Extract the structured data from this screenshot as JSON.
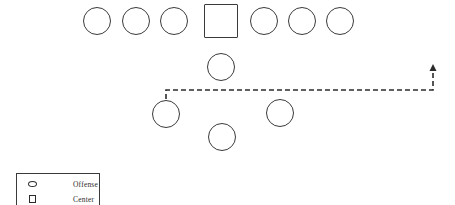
{
  "diagram": {
    "type": "american-football-play-formation",
    "width": 455,
    "height": 205,
    "background_color": "#ffffff",
    "stroke_color": "#3a3a3a",
    "players": [
      {
        "id": "ol-1",
        "role": "Offense",
        "shape": "circle",
        "cx": 97,
        "cy": 21,
        "r": 14
      },
      {
        "id": "ol-2",
        "role": "Offense",
        "shape": "circle",
        "cx": 136,
        "cy": 21,
        "r": 14
      },
      {
        "id": "ol-3",
        "role": "Offense",
        "shape": "circle",
        "cx": 174,
        "cy": 21,
        "r": 14
      },
      {
        "id": "center",
        "role": "Center",
        "shape": "square",
        "cx": 221,
        "cy": 21,
        "r": 17
      },
      {
        "id": "ol-4",
        "role": "Offense",
        "shape": "circle",
        "cx": 264,
        "cy": 21,
        "r": 14
      },
      {
        "id": "ol-5",
        "role": "Offense",
        "shape": "circle",
        "cx": 302,
        "cy": 21,
        "r": 14
      },
      {
        "id": "ol-6",
        "role": "Offense",
        "shape": "circle",
        "cx": 340,
        "cy": 21,
        "r": 14
      },
      {
        "id": "qb",
        "role": "Offense",
        "shape": "circle",
        "cx": 221,
        "cy": 67,
        "r": 14
      },
      {
        "id": "back-left",
        "role": "Offense",
        "shape": "circle",
        "cx": 166,
        "cy": 114,
        "r": 14
      },
      {
        "id": "back-right",
        "role": "Offense",
        "shape": "circle",
        "cx": 280,
        "cy": 113,
        "r": 14
      },
      {
        "id": "back-center",
        "role": "Offense",
        "shape": "circle",
        "cx": 222,
        "cy": 137,
        "r": 14
      }
    ],
    "routes": [
      {
        "id": "motion-route",
        "style": "dashed",
        "dash_pattern": "5,3",
        "arrow_head": "up",
        "points": [
          {
            "x": 166,
            "y": 99
          },
          {
            "x": 166,
            "y": 90
          },
          {
            "x": 433,
            "y": 90
          },
          {
            "x": 433,
            "y": 65
          }
        ]
      }
    ]
  },
  "legend": {
    "box": {
      "x": 16,
      "y": 173,
      "width": 84,
      "height": 34
    },
    "items": [
      {
        "icon": "oval-icon",
        "label": "Offense"
      },
      {
        "icon": "square-icon",
        "label": "Center"
      }
    ]
  }
}
